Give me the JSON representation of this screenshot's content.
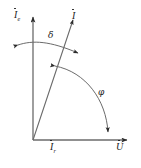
{
  "figure": {
    "background_color": "#ffffff",
    "line_color": "#4a4a4a",
    "text_color": "#1a1a1a",
    "axes": {
      "vertical": {
        "name": "excitation-current-axis",
        "label_base": "I",
        "label_subscript": "e",
        "has_arrowhead": true,
        "direction": "up"
      },
      "horizontal": {
        "name": "voltage-axis",
        "label_base": "U",
        "label_subscript": "",
        "has_arrowhead": true,
        "direction": "right"
      }
    },
    "vectors": [
      {
        "name": "current-phasor",
        "label_base": "I",
        "label_subscript": "",
        "has_arrowhead": true,
        "angle_from_vertical_deg": 18
      },
      {
        "name": "reactive-current-component",
        "label_base": "I",
        "label_subscript": "r",
        "has_arrowhead": false
      }
    ],
    "angles": [
      {
        "name": "delta-angle",
        "symbol": "δ",
        "between": "vertical-axis and current-phasor",
        "arc_style": "double-headed"
      },
      {
        "name": "phi-angle",
        "symbol": "φ",
        "between": "current-phasor and horizontal-axis",
        "arc_style": "double-headed"
      }
    ]
  }
}
